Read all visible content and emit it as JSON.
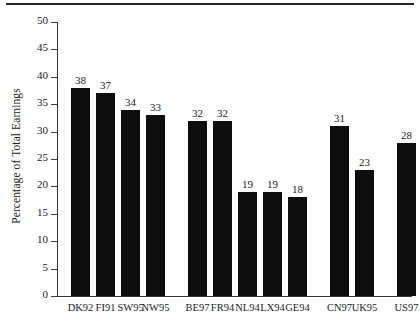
{
  "chart_data": {
    "type": "bar",
    "title": "",
    "subtitle": "",
    "xlabel": "",
    "ylabel": "Percentage of Total Earnings",
    "ylim": [
      0,
      50
    ],
    "yticks": [
      0,
      5,
      10,
      15,
      20,
      25,
      30,
      35,
      40,
      45,
      50
    ],
    "ytick_labels": [
      "0",
      "5",
      "10",
      "15",
      "20",
      "25",
      "30",
      "35",
      "40",
      "45",
      "50"
    ],
    "grid": false,
    "legend": null,
    "bar_color": "#0d0d0d",
    "categories": [
      "DK92",
      "FI91",
      "SW95",
      "NW95",
      "BE97",
      "FR94",
      "NL94",
      "LX94",
      "GE94",
      "CN97",
      "UK95",
      "US97"
    ],
    "values": [
      38,
      37,
      34,
      33,
      32,
      32,
      19,
      19,
      18,
      31,
      23,
      28
    ],
    "data_labels": [
      "38",
      "37",
      "34",
      "33",
      "32",
      "32",
      "19",
      "19",
      "18",
      "31",
      "23",
      "28"
    ],
    "groups": [
      {
        "name": "group-1",
        "categories": [
          "DK92",
          "FI91",
          "SW95",
          "NW95"
        ],
        "values": [
          38,
          37,
          34,
          33
        ]
      },
      {
        "name": "group-2",
        "categories": [
          "BE97",
          "FR94",
          "NL94",
          "LX94",
          "GE94"
        ],
        "values": [
          32,
          32,
          19,
          19,
          18
        ]
      },
      {
        "name": "group-3",
        "categories": [
          "CN97",
          "UK95",
          "US97"
        ],
        "values": [
          31,
          23,
          28
        ]
      }
    ],
    "bar_layout": [
      {
        "category": "DK92",
        "value": 38,
        "x": 14,
        "width": 19
      },
      {
        "category": "FI91",
        "value": 37,
        "x": 39,
        "width": 19
      },
      {
        "category": "SW95",
        "value": 34,
        "x": 64,
        "width": 19
      },
      {
        "category": "NW95",
        "value": 33,
        "x": 89,
        "width": 19
      },
      {
        "category": "BE97",
        "value": 32,
        "x": 131,
        "width": 19
      },
      {
        "category": "FR94",
        "value": 32,
        "x": 156,
        "width": 19
      },
      {
        "category": "NL94",
        "value": 19,
        "x": 181,
        "width": 19
      },
      {
        "category": "LX94",
        "value": 19,
        "x": 206,
        "width": 19
      },
      {
        "category": "GE94",
        "value": 18,
        "x": 231,
        "width": 19
      },
      {
        "category": "CN97",
        "value": 31,
        "x": 273,
        "width": 19
      },
      {
        "category": "UK95",
        "value": 23,
        "x": 298,
        "width": 19
      },
      {
        "category": "US97",
        "value": 28,
        "x": 340,
        "width": 19
      }
    ]
  }
}
